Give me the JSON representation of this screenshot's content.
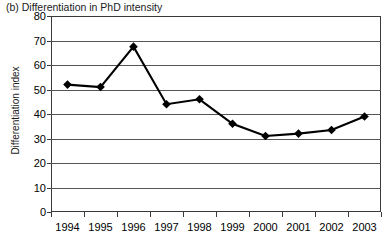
{
  "chart_data": {
    "type": "line",
    "title": "(b) Differentiation in PhD intensity",
    "xlabel": "",
    "ylabel": "Differentiation index",
    "categories": [
      "1994",
      "1995",
      "1996",
      "1997",
      "1998",
      "1999",
      "2000",
      "2001",
      "2002",
      "2003"
    ],
    "values": [
      52,
      51,
      67.5,
      44,
      46,
      36,
      31,
      32,
      33.5,
      39
    ],
    "series": [
      {
        "name": "Differentiation index",
        "values": [
          52,
          51,
          67.5,
          44,
          46,
          36,
          31,
          32,
          33.5,
          39
        ]
      }
    ],
    "ylim": [
      0,
      80
    ],
    "yticks": [
      0,
      10,
      20,
      30,
      40,
      50,
      60,
      70,
      80
    ],
    "ytick_labels": [
      "0",
      "10",
      "20",
      "30",
      "40",
      "50",
      "60",
      "70",
      "80"
    ],
    "grid": "horizontal",
    "legend": "none",
    "marker": "diamond",
    "line_color": "#000000",
    "marker_color": "#000000",
    "grid_color": "#555555",
    "axis_color": "#3a3a3a"
  }
}
